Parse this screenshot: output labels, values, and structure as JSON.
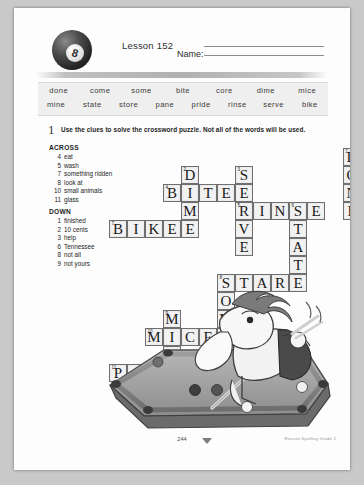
{
  "header": {
    "lesson_label": "Lesson 152",
    "name_label": "Name:",
    "ball_number": "8"
  },
  "word_bank": {
    "row1": [
      "done",
      "come",
      "some",
      "bite",
      "core",
      "dime",
      "mice"
    ],
    "row2": [
      "mine",
      "state",
      "store",
      "pane",
      "pride",
      "rinse",
      "serve",
      "bike"
    ]
  },
  "instruction": {
    "number": "1",
    "text": "Use the clues to solve the crossword puzzle. Not all of the words will be used."
  },
  "clues": {
    "across_heading": "ACROSS",
    "across": [
      {
        "num": "4",
        "text": "eat"
      },
      {
        "num": "5",
        "text": "wash"
      },
      {
        "num": "7",
        "text": "something ridden"
      },
      {
        "num": "8",
        "text": "look at"
      },
      {
        "num": "10",
        "text": "small animals"
      },
      {
        "num": "11",
        "text": "glass"
      }
    ],
    "down_heading": "DOWN",
    "down": [
      {
        "num": "1",
        "text": "finished"
      },
      {
        "num": "2",
        "text": "10 cents"
      },
      {
        "num": "3",
        "text": "help"
      },
      {
        "num": "6",
        "text": "Tennessee"
      },
      {
        "num": "8",
        "text": "not all"
      },
      {
        "num": "9",
        "text": "not yours"
      }
    ]
  },
  "crossword": {
    "cell_size": 18,
    "answers": {
      "across": [
        {
          "num": "4",
          "word": "BITE"
        },
        {
          "num": "5",
          "word": "RINSE"
        },
        {
          "num": "7",
          "word": "BIKE"
        },
        {
          "num": "8",
          "word": "STARE"
        },
        {
          "num": "10",
          "word": "MICE"
        },
        {
          "num": "11",
          "word": "PANE"
        }
      ],
      "down": [
        {
          "num": "1",
          "word": "DONE"
        },
        {
          "num": "2",
          "word": "DIME"
        },
        {
          "num": "3",
          "word": "SERVE"
        },
        {
          "num": "6",
          "word": "STATE"
        },
        {
          "num": "8",
          "word": "SOME"
        },
        {
          "num": "9",
          "word": "MINE"
        }
      ]
    },
    "cells": [
      {
        "c": 13,
        "r": 0,
        "l": "D",
        "n": "1"
      },
      {
        "c": 13,
        "r": 1,
        "l": "O",
        "n": ""
      },
      {
        "c": 13,
        "r": 2,
        "l": "N",
        "n": ""
      },
      {
        "c": 13,
        "r": 3,
        "l": "E",
        "n": ""
      },
      {
        "c": 4,
        "r": 1,
        "l": "D",
        "n": "2"
      },
      {
        "c": 7,
        "r": 1,
        "l": "S",
        "n": "3"
      },
      {
        "c": 3,
        "r": 2,
        "l": "B",
        "n": "4"
      },
      {
        "c": 4,
        "r": 2,
        "l": "I",
        "n": ""
      },
      {
        "c": 5,
        "r": 2,
        "l": "T",
        "n": ""
      },
      {
        "c": 6,
        "r": 2,
        "l": "E",
        "n": ""
      },
      {
        "c": 7,
        "r": 2,
        "l": "E",
        "n": ""
      },
      {
        "c": 4,
        "r": 3,
        "l": "M",
        "n": ""
      },
      {
        "c": 7,
        "r": 3,
        "l": "R",
        "n": "5"
      },
      {
        "c": 8,
        "r": 3,
        "l": "I",
        "n": ""
      },
      {
        "c": 9,
        "r": 3,
        "l": "N",
        "n": ""
      },
      {
        "c": 10,
        "r": 3,
        "l": "S",
        "n": "6"
      },
      {
        "c": 11,
        "r": 3,
        "l": "E",
        "n": ""
      },
      {
        "c": 0,
        "r": 4,
        "l": "B",
        "n": "7"
      },
      {
        "c": 1,
        "r": 4,
        "l": "I",
        "n": ""
      },
      {
        "c": 2,
        "r": 4,
        "l": "K",
        "n": ""
      },
      {
        "c": 3,
        "r": 4,
        "l": "E",
        "n": ""
      },
      {
        "c": 4,
        "r": 4,
        "l": "E",
        "n": ""
      },
      {
        "c": 7,
        "r": 4,
        "l": "V",
        "n": ""
      },
      {
        "c": 10,
        "r": 4,
        "l": "T",
        "n": ""
      },
      {
        "c": 7,
        "r": 5,
        "l": "E",
        "n": ""
      },
      {
        "c": 10,
        "r": 5,
        "l": "A",
        "n": ""
      },
      {
        "c": 10,
        "r": 6,
        "l": "T",
        "n": ""
      },
      {
        "c": 6,
        "r": 7,
        "l": "S",
        "n": "8"
      },
      {
        "c": 7,
        "r": 7,
        "l": "T",
        "n": ""
      },
      {
        "c": 8,
        "r": 7,
        "l": "A",
        "n": ""
      },
      {
        "c": 9,
        "r": 7,
        "l": "R",
        "n": ""
      },
      {
        "c": 10,
        "r": 7,
        "l": "E",
        "n": ""
      },
      {
        "c": 6,
        "r": 8,
        "l": "O",
        "n": ""
      },
      {
        "c": 3,
        "r": 9,
        "l": "M",
        "n": "9"
      },
      {
        "c": 6,
        "r": 9,
        "l": "M",
        "n": ""
      },
      {
        "c": 2,
        "r": 10,
        "l": "M",
        "n": "10"
      },
      {
        "c": 3,
        "r": 10,
        "l": "I",
        "n": ""
      },
      {
        "c": 4,
        "r": 10,
        "l": "C",
        "n": ""
      },
      {
        "c": 5,
        "r": 10,
        "l": "E",
        "n": ""
      },
      {
        "c": 6,
        "r": 10,
        "l": "E",
        "n": ""
      },
      {
        "c": 3,
        "r": 11,
        "l": "N",
        "n": ""
      },
      {
        "c": 0,
        "r": 12,
        "l": "P",
        "n": "11"
      },
      {
        "c": 1,
        "r": 12,
        "l": "A",
        "n": ""
      },
      {
        "c": 2,
        "r": 12,
        "l": "N",
        "n": ""
      },
      {
        "c": 3,
        "r": 12,
        "l": "E",
        "n": ""
      }
    ]
  },
  "footer": {
    "page_number": "244",
    "credit": "Reason Spelling Grade 2"
  }
}
